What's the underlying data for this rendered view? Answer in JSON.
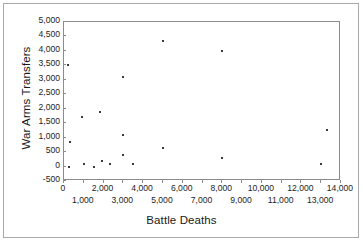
{
  "chart_data": {
    "type": "scatter",
    "title": "",
    "xlabel": "Battle Deaths",
    "ylabel": "War Arms Transfers",
    "xlim": [
      0,
      14000
    ],
    "ylim": [
      -500,
      5000
    ],
    "grid": false,
    "legend": null,
    "marker": "small-square",
    "marker_color": "#3a3a3a",
    "x_tick_labels_row_a": [
      "0",
      "2,000",
      "4,000",
      "6,000",
      "8,000",
      "10,000",
      "12,000",
      "14,000"
    ],
    "x_tick_values_row_a": [
      0,
      2000,
      4000,
      6000,
      8000,
      10000,
      12000,
      14000
    ],
    "x_tick_labels_row_b": [
      "1,000",
      "3,000",
      "5,000",
      "7,000",
      "9,000",
      "11,000",
      "13,000"
    ],
    "x_tick_values_row_b": [
      1000,
      3000,
      5000,
      7000,
      9000,
      11000,
      13000
    ],
    "y_tick_labels": [
      "5,000",
      "4,500",
      "4,000",
      "3,500",
      "3,000",
      "2,500",
      "2,000",
      "1,500",
      "1,000",
      "500",
      "0",
      "-500"
    ],
    "y_tick_values": [
      5000,
      4500,
      4000,
      3500,
      3000,
      2500,
      2000,
      1500,
      1000,
      500,
      0,
      -500
    ],
    "points": [
      {
        "x": 200,
        "y": 3500
      },
      {
        "x": 250,
        "y": 0
      },
      {
        "x": 300,
        "y": 850
      },
      {
        "x": 900,
        "y": 1700
      },
      {
        "x": 1000,
        "y": 100
      },
      {
        "x": 1500,
        "y": 0
      },
      {
        "x": 1800,
        "y": 1900
      },
      {
        "x": 1900,
        "y": 200
      },
      {
        "x": 2300,
        "y": 100
      },
      {
        "x": 3000,
        "y": 3100
      },
      {
        "x": 3000,
        "y": 1100
      },
      {
        "x": 3000,
        "y": 400
      },
      {
        "x": 3500,
        "y": 100
      },
      {
        "x": 5000,
        "y": 4350
      },
      {
        "x": 5000,
        "y": 650
      },
      {
        "x": 8000,
        "y": 4000
      },
      {
        "x": 8000,
        "y": 300
      },
      {
        "x": 13000,
        "y": 100
      },
      {
        "x": 13300,
        "y": 1250
      }
    ]
  },
  "axes": {
    "x_title": "Battle Deaths",
    "y_title": "War Arms Transfers"
  }
}
